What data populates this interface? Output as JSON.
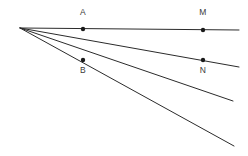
{
  "figure": {
    "canvas": {
      "width": 248,
      "height": 156,
      "background": "#ffffff"
    },
    "stroke_color": "#2b2b2b",
    "point_color": "#1a1a1a",
    "label_color": "#3a3a3a",
    "vertex": {
      "name": "vertex",
      "x": 20,
      "y": 28
    },
    "rays": [
      {
        "name": "ray-1-horizontal",
        "x1": 20,
        "y1": 28,
        "x2": 239,
        "y2": 30
      },
      {
        "name": "ray-2",
        "x1": 20,
        "y1": 28,
        "x2": 239,
        "y2": 67
      },
      {
        "name": "ray-3",
        "x1": 20,
        "y1": 28,
        "x2": 233,
        "y2": 101
      },
      {
        "name": "ray-4",
        "x1": 20,
        "y1": 28,
        "x2": 234,
        "y2": 146
      }
    ],
    "points": [
      {
        "id": "A",
        "label": "A",
        "x": 83,
        "y": 29,
        "label_x": 83,
        "label_y": 13,
        "radius": 2.2
      },
      {
        "id": "M",
        "label": "M",
        "x": 203,
        "y": 30,
        "label_x": 203,
        "label_y": 13,
        "radius": 2.2
      },
      {
        "id": "B",
        "label": "B",
        "x": 83,
        "y": 60,
        "label_x": 83,
        "label_y": 71,
        "radius": 2.2
      },
      {
        "id": "N",
        "label": "N",
        "x": 203,
        "y": 60,
        "label_x": 203,
        "label_y": 71,
        "radius": 2.2
      }
    ]
  },
  "chart_data": {
    "type": "scatter",
    "xlabel": "",
    "ylabel": "",
    "xlim": [
      0,
      248
    ],
    "ylim": [
      0,
      156
    ],
    "grid": false,
    "legend": null,
    "series": [
      {
        "name": "labeled-points",
        "x": [
          83,
          203,
          83,
          203
        ],
        "y": [
          29,
          30,
          60,
          60
        ],
        "labels": [
          "A",
          "M",
          "B",
          "N"
        ]
      }
    ],
    "annotations": [
      {
        "text": "A",
        "x": 83,
        "y": 13
      },
      {
        "text": "M",
        "x": 203,
        "y": 13
      },
      {
        "text": "B",
        "x": 83,
        "y": 71
      },
      {
        "text": "N",
        "x": 203,
        "y": 71
      }
    ]
  }
}
